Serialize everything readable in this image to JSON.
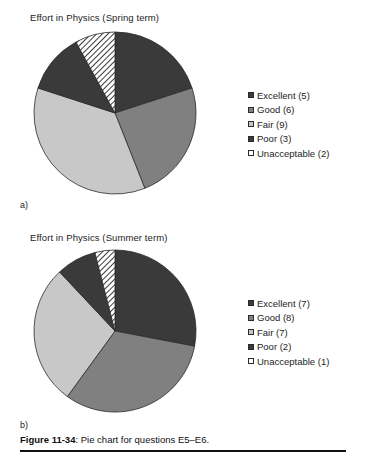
{
  "figure": {
    "caption_label": "Figure 11-34",
    "caption_text": ": Pie chart for questions E5–E6."
  },
  "panels": [
    {
      "letter": "a)",
      "title": "Effort in Physics (Spring term)"
    },
    {
      "letter": "b)",
      "title": "Effort in Physics (Summer term)"
    }
  ],
  "palette": {
    "excellent": "#3a3a3a",
    "good": "#808080",
    "fair": "#c8c8c8",
    "poor": "#3a3a3a",
    "unacceptable": "#ffffff",
    "outline": "#2b2b2b",
    "hatch_line": "#3a3a3a",
    "background": "#ffffff",
    "text": "#1d1d1d"
  },
  "legends": [
    {
      "items": [
        {
          "label": "Excellent (5)",
          "swatch": "dark"
        },
        {
          "label": "Good (6)",
          "swatch": "mid"
        },
        {
          "label": "Fair (9)",
          "swatch": "light"
        },
        {
          "label": "Poor (3)",
          "swatch": "dark"
        },
        {
          "label": "Unacceptable (2)",
          "swatch": "hatch"
        }
      ]
    },
    {
      "items": [
        {
          "label": "Excellent (7)",
          "swatch": "dark"
        },
        {
          "label": "Good (8)",
          "swatch": "mid"
        },
        {
          "label": "Fair (7)",
          "swatch": "light"
        },
        {
          "label": "Poor (2)",
          "swatch": "dark"
        },
        {
          "label": "Unacceptable (1)",
          "swatch": "hatch"
        }
      ]
    }
  ],
  "chart_data": [
    {
      "type": "pie",
      "title": "Effort in Physics (Spring term)",
      "panel": "a)",
      "categories": [
        "Excellent",
        "Good",
        "Fair",
        "Poor",
        "Unacceptable"
      ],
      "values": [
        5,
        6,
        9,
        3,
        2
      ],
      "total": 25,
      "percentages": [
        20,
        24,
        36,
        12,
        8
      ],
      "start_angle_deg": 0,
      "direction": "clockwise",
      "legend_position": "right",
      "legend_entries": [
        "Excellent (5)",
        "Good (6)",
        "Fair (9)",
        "Poor (3)",
        "Unacceptable (2)"
      ],
      "slice_fills": [
        "#3a3a3a",
        "#808080",
        "#c8c8c8",
        "#3a3a3a",
        "diagonal-hatch"
      ]
    },
    {
      "type": "pie",
      "title": "Effort in Physics (Summer term)",
      "panel": "b)",
      "categories": [
        "Excellent",
        "Good",
        "Fair",
        "Poor",
        "Unacceptable"
      ],
      "values": [
        7,
        8,
        7,
        2,
        1
      ],
      "total": 25,
      "percentages": [
        28,
        32,
        28,
        8,
        4
      ],
      "start_angle_deg": 0,
      "direction": "clockwise",
      "legend_position": "right",
      "legend_entries": [
        "Excellent (7)",
        "Good (8)",
        "Fair (7)",
        "Poor (2)",
        "Unacceptable (1)"
      ],
      "slice_fills": [
        "#3a3a3a",
        "#808080",
        "#c8c8c8",
        "#3a3a3a",
        "diagonal-hatch"
      ]
    }
  ]
}
